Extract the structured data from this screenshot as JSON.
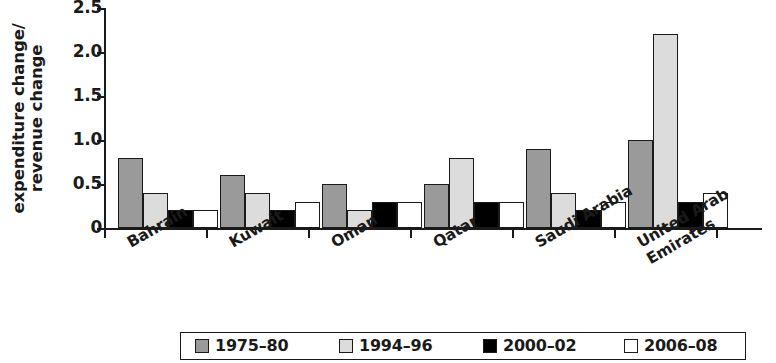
{
  "chart_data": {
    "type": "bar",
    "title": "",
    "subtitle": "",
    "xlabel": "",
    "ylabel": "expenditure change/ revenue change",
    "ylabel_lines": [
      "expenditure change/",
      "revenue change"
    ],
    "categories": [
      "Bahrain",
      "Kuwait",
      "Oman",
      "Qatar",
      "Saudi Arabia",
      "United Arab Emirates"
    ],
    "category_lines": [
      [
        "Bahrain"
      ],
      [
        "Kuwait"
      ],
      [
        "Oman"
      ],
      [
        "Qatar"
      ],
      [
        "Saudi Arabia"
      ],
      [
        "United Arab",
        "Emirates"
      ]
    ],
    "series": [
      {
        "name": "1975–80",
        "color": "#9a9a9a",
        "values": [
          0.8,
          0.6,
          0.5,
          0.5,
          0.9,
          1.0
        ]
      },
      {
        "name": "1994–96",
        "color": "#dcdcdc",
        "values": [
          0.4,
          0.4,
          0.2,
          0.8,
          0.4,
          2.2
        ]
      },
      {
        "name": "2000–02",
        "color": "#000000",
        "values": [
          0.2,
          0.2,
          0.3,
          0.3,
          0.2,
          0.3
        ]
      },
      {
        "name": "2006–08",
        "color": "#ffffff",
        "values": [
          0.2,
          0.3,
          0.3,
          0.3,
          0.3,
          0.4
        ]
      }
    ],
    "ylim": [
      0,
      2.5
    ],
    "yticks": [
      0,
      0.5,
      1.0,
      1.5,
      2.0,
      2.5
    ],
    "ytick_labels": [
      "0",
      "0.5",
      "1.0",
      "1.5",
      "2.0",
      "2.5"
    ],
    "grid": false,
    "legend_position": "bottom",
    "axis_color": "#1a1a1a"
  }
}
